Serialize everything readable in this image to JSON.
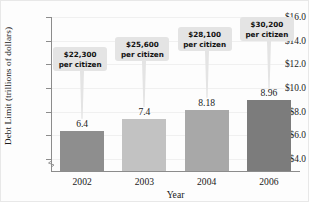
{
  "chart_data": {
    "type": "bar",
    "title": "",
    "xlabel": "Year",
    "ylabel": "Debt Limit (trillions of dollars)",
    "categories": [
      "2002",
      "2003",
      "2004",
      "2006"
    ],
    "values": [
      6.4,
      7.4,
      8.18,
      8.96
    ],
    "value_labels": [
      "6.4",
      "7.4",
      "8.18",
      "8.96"
    ],
    "ylim": [
      3.0,
      16.0
    ],
    "y_axis_broken": true,
    "ytick_labels": [
      "$16.0",
      "$14.0",
      "$12.0",
      "$10.0",
      "$8.0",
      "$6.0",
      "$4.0"
    ],
    "ytick_values": [
      16.0,
      14.0,
      12.0,
      10.0,
      8.0,
      6.0,
      4.0
    ],
    "grid": true,
    "legend": "none",
    "bar_colors": [
      "#8e8e8e",
      "#c2c2c2",
      "#a8a8a8",
      "#7c7c7c"
    ],
    "annotations": [
      {
        "line1": "$22,300",
        "line2": "per citizen",
        "series_index": 0
      },
      {
        "line1": "$25,600",
        "line2": "per citizen",
        "series_index": 1
      },
      {
        "line1": "$28,100",
        "line2": "per citizen",
        "series_index": 2
      },
      {
        "line1": "$30,200",
        "line2": "per citizen",
        "series_index": 3
      }
    ]
  },
  "axis": {
    "yticks": [
      {
        "label": "$16.0"
      },
      {
        "label": "$14.0"
      },
      {
        "label": "$12.0"
      },
      {
        "label": "$10.0"
      },
      {
        "label": "$8.0"
      },
      {
        "label": "$6.0"
      },
      {
        "label": "$4.0"
      }
    ],
    "xticks": [
      {
        "label": "2002"
      },
      {
        "label": "2003"
      },
      {
        "label": "2004"
      },
      {
        "label": "2006"
      }
    ],
    "xtitle": "Year",
    "ytitle": "Debt Limit (trillions of dollars)"
  },
  "bars": [
    {
      "value_label": "6.4"
    },
    {
      "value_label": "7.4"
    },
    {
      "value_label": "8.18"
    },
    {
      "value_label": "8.96"
    }
  ],
  "callouts": [
    {
      "amount": "$22,300",
      "unit": "per citizen"
    },
    {
      "amount": "$25,600",
      "unit": "per citizen"
    },
    {
      "amount": "$28,100",
      "unit": "per citizen"
    },
    {
      "amount": "$30,200",
      "unit": "per citizen"
    }
  ]
}
